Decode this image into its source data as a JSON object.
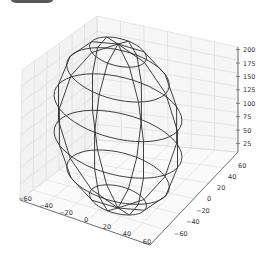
{
  "chart_data": {
    "type": "wireframe3d",
    "title": "",
    "xlabel": "",
    "ylabel": "",
    "zlabel": "",
    "surface": "sphere",
    "center": [
      0,
      0,
      100
    ],
    "radius": 60,
    "z_radius": 100,
    "latitude_rings": 7,
    "meridians": 8,
    "x_ticks": [
      -60,
      -40,
      -20,
      0,
      20,
      40,
      60
    ],
    "y_ticks": [
      -60,
      -40,
      -20,
      0,
      20,
      40,
      60
    ],
    "z_ticks": [
      25,
      50,
      75,
      100,
      125,
      150,
      175,
      200
    ],
    "xlim": [
      -70,
      70
    ],
    "ylim": [
      -70,
      70
    ],
    "zlim": [
      0,
      210
    ],
    "grid": true,
    "line_color": "#333333",
    "grid_color": "#dcdcdc",
    "pane_color": "#f2f2f2"
  },
  "colors": {
    "wire": "#2b2b2b",
    "grid": "#d9d9d9",
    "axis": "#555555"
  }
}
